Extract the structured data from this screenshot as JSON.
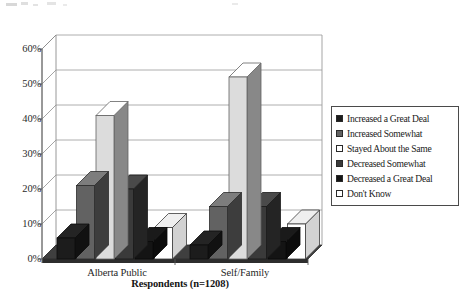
{
  "chart_data": {
    "type": "bar",
    "title": "",
    "subtitle": "",
    "xlabel": "Respondents (n=1208)",
    "ylabel": "",
    "ylim": [
      0,
      60
    ],
    "ytick_labels": [
      "60%",
      "50%",
      "40%",
      "30%",
      "20%",
      "10%",
      "0%"
    ],
    "ytick_values": [
      60,
      50,
      40,
      30,
      20,
      10,
      0
    ],
    "grid": true,
    "legend_position": "right",
    "style": "3d-clustered-bar",
    "categories": [
      "Alberta Public",
      "Self/Family"
    ],
    "series": [
      {
        "name": "Increased a Great Deal",
        "values": [
          6,
          4
        ],
        "color": "#1c1c1c"
      },
      {
        "name": "Increased Somewhat",
        "values": [
          21,
          15
        ],
        "color": "#626262"
      },
      {
        "name": "Stayed About the Same",
        "values": [
          41,
          52
        ],
        "color": "#dcdcdc"
      },
      {
        "name": "Decreased Somewhat",
        "values": [
          20,
          15
        ],
        "color": "#3a3a3a"
      },
      {
        "name": "Decreased a Great Deal",
        "values": [
          5,
          5
        ],
        "color": "#141414"
      },
      {
        "name": "Don't Know",
        "values": [
          9,
          10
        ],
        "color": "#ffffff"
      }
    ]
  },
  "axis": {
    "x_title": "Respondents (n=1208)"
  },
  "legend": {
    "items": [
      {
        "label": "Increased a Great Deal"
      },
      {
        "label": "Increased Somewhat"
      },
      {
        "label": "Stayed About the Same"
      },
      {
        "label": "Decreased Somewhat"
      },
      {
        "label": "Decreased a Great Deal"
      },
      {
        "label": "Don't Know"
      }
    ]
  }
}
